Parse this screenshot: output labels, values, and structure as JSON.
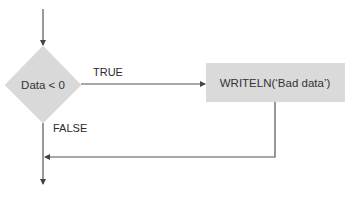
{
  "diagram": {
    "type": "flowchart",
    "nodes": [
      {
        "id": "decision",
        "shape": "diamond",
        "label": "Data < 0",
        "fill": "#d9d9d9"
      },
      {
        "id": "action",
        "shape": "rectangle",
        "label": "WRITELN(‘Bad data’)",
        "fill": "#dadada"
      }
    ],
    "edges": [
      {
        "from": "entry",
        "to": "decision",
        "label": ""
      },
      {
        "from": "decision",
        "to": "action",
        "label": "TRUE"
      },
      {
        "from": "decision",
        "to": "exit",
        "label": "FALSE"
      },
      {
        "from": "action",
        "to": "merge",
        "label": ""
      },
      {
        "from": "merge",
        "to": "exit",
        "label": ""
      }
    ],
    "labels": {
      "true_label": "TRUE",
      "false_label": "FALSE"
    },
    "colors": {
      "line": "#555555",
      "text": "#2a2a2a",
      "shape_fill": "#d9d9d9"
    }
  }
}
